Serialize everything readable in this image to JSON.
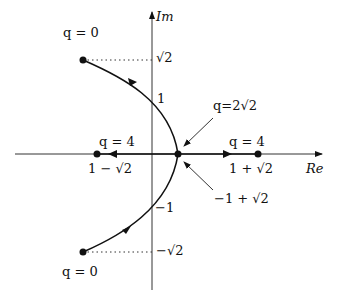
{
  "diagram": {
    "type": "root-locus",
    "axes": {
      "real_label": "Re",
      "imag_label": "Im"
    },
    "labels": {
      "q0_top": "q = 0",
      "q0_bottom": "q = 0",
      "sqrt2": "√2",
      "neg_sqrt2": "−√2",
      "one": "1",
      "neg_one": "−1",
      "q_break": "q=2√2",
      "q4_left": "q = 4",
      "q4_right": "q = 4",
      "left_point": "1 − √2",
      "right_point": "1 + √2",
      "break_point": "−1 + √2"
    },
    "points": [
      {
        "name": "q0-top",
        "re": -1,
        "im": 1.414
      },
      {
        "name": "q0-bottom",
        "re": -1,
        "im": -1.414
      },
      {
        "name": "breakaway",
        "re": 0.414,
        "im": 0
      },
      {
        "name": "q4-left",
        "re": -0.414,
        "im": 0
      },
      {
        "name": "q4-right",
        "re": 2.414,
        "im": 0
      }
    ]
  }
}
